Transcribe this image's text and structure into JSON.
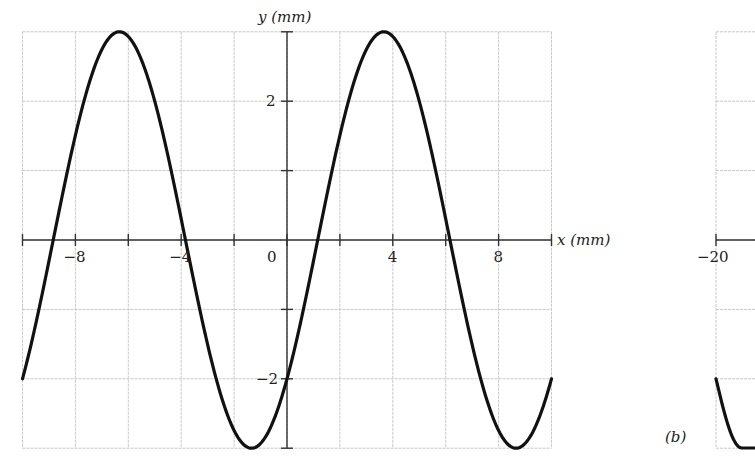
{
  "chart_data": [
    {
      "panel": "a",
      "type": "line",
      "title": "",
      "xlabel": "x (mm)",
      "ylabel": "y (mm)",
      "xlim": [
        -10,
        10
      ],
      "ylim": [
        -3,
        3
      ],
      "x_ticks": [
        -8,
        -4,
        0,
        4,
        8
      ],
      "x_minor_ticks": [
        -10,
        -6,
        -2,
        2,
        6,
        10
      ],
      "y_ticks": [
        -2,
        2
      ],
      "y_minor_ticks": [
        -3,
        -1,
        1,
        3
      ],
      "grid": true,
      "grid_spacing": {
        "x": 2,
        "y": 1
      },
      "series": [
        {
          "name": "y(x)",
          "function": "3*sin(2*pi*x/10 - 0.73)",
          "amplitude_mm": 3,
          "wavelength_mm": 10,
          "y_at_x0": -2,
          "x": [
            -10,
            -9,
            -8,
            -7,
            -6.34,
            -6,
            -5,
            -4,
            -3,
            -2,
            -1.34,
            -1,
            0,
            1,
            1.16,
            2,
            3,
            3.66,
            4,
            5,
            6,
            6.16,
            7,
            8,
            8.66,
            9,
            10
          ],
          "y": [
            -2.0,
            0.5,
            2.6,
            2.95,
            3.0,
            2.9,
            2.0,
            0.5,
            -1.2,
            -2.5,
            -3.0,
            -2.95,
            -2.0,
            -0.3,
            0.0,
            1.5,
            2.8,
            3.0,
            2.95,
            2.0,
            0.3,
            0.0,
            -1.5,
            -2.8,
            -3.0,
            -2.95,
            -2.0
          ]
        }
      ]
    },
    {
      "panel": "b",
      "type": "line",
      "label": "(b)",
      "x_ticks_visible": [
        -20
      ],
      "note": "partially cropped at right edge"
    }
  ],
  "panel_a": {
    "ylabel": "y (mm)",
    "xlabel": "x (mm)",
    "ytick_labels": [
      {
        "v": 2,
        "t": "2"
      },
      {
        "v": -2,
        "t": "−2"
      }
    ],
    "xtick_labels": [
      {
        "v": -8,
        "t": "−8"
      },
      {
        "v": -4,
        "t": "−4"
      },
      {
        "v": 0,
        "t": "0"
      },
      {
        "v": 4,
        "t": "4"
      },
      {
        "v": 8,
        "t": "8"
      }
    ]
  },
  "panel_b": {
    "label": "(b)",
    "xtick_label": "−20"
  },
  "style": {
    "curve_color": "#111111",
    "axis_color": "#333333",
    "grid_color": "#c8c8c8"
  }
}
